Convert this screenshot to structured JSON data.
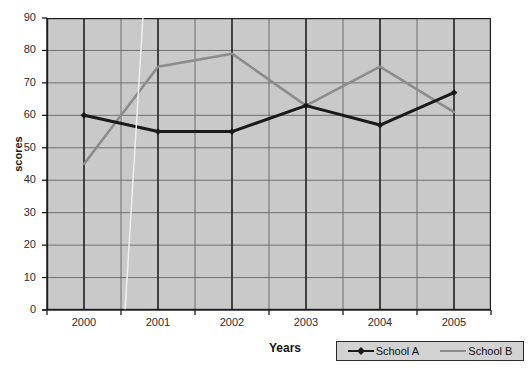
{
  "chart_data": {
    "type": "line",
    "title": "Annual scores",
    "xlabel": "Years",
    "ylabel": "scores",
    "categories": [
      "2000",
      "2001",
      "2002",
      "2003",
      "2004",
      "2005"
    ],
    "x": [
      2000,
      2001,
      2002,
      2003,
      2004,
      2005
    ],
    "series": [
      {
        "name": "School A",
        "color": "#1a1a1a",
        "marker": "diamond",
        "values": [
          60,
          55,
          55,
          63,
          57,
          67
        ]
      },
      {
        "name": "School B",
        "color": "#8c8c8c",
        "marker": "none",
        "values": [
          45,
          75,
          79,
          63,
          75,
          61
        ]
      }
    ],
    "ylim": [
      0,
      90
    ],
    "ytick_step": 10,
    "yticks": [
      "90",
      "80",
      "70",
      "60",
      "50",
      "40",
      "30",
      "20",
      "10",
      "0"
    ],
    "ytick_values": [
      90,
      80,
      70,
      60,
      50,
      40,
      30,
      20,
      10,
      0
    ],
    "grid": "both",
    "grid_horizontal": true,
    "grid_vertical": true,
    "legend_position": "bottom-right",
    "plot_background": "#c9c9c9",
    "page_background": "#ffffff"
  },
  "legend": {
    "items": [
      {
        "label": "School A"
      },
      {
        "label": "School B"
      }
    ]
  },
  "icons": {
    "diamond_marker": "diamond-marker-icon",
    "line_marker": "line-swatch-icon"
  }
}
